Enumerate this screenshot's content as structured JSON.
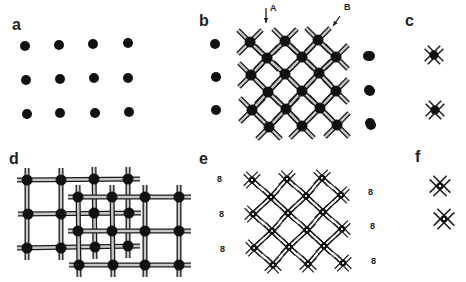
{
  "figure": {
    "panels": [
      {
        "id": "a",
        "label": "a",
        "label_pos": [
          12,
          28
        ]
      },
      {
        "id": "b",
        "label": "b",
        "label_pos": [
          200,
          24
        ]
      },
      {
        "id": "c",
        "label": "c",
        "label_pos": [
          405,
          24
        ]
      },
      {
        "id": "d",
        "label": "d",
        "label_pos": [
          10,
          165
        ]
      },
      {
        "id": "e",
        "label": "e",
        "label_pos": [
          200,
          165
        ]
      },
      {
        "id": "f",
        "label": "f",
        "label_pos": [
          414,
          163
        ]
      }
    ],
    "arrows": [
      {
        "label": "A",
        "label_pos": [
          270,
          8
        ],
        "from": [
          266,
          8
        ],
        "to": [
          266,
          23
        ]
      },
      {
        "label": "B",
        "label_pos": [
          345,
          6
        ],
        "from": [
          340,
          16
        ],
        "to": [
          333,
          26
        ]
      }
    ],
    "colors": {
      "dot": "#111111",
      "rod_outline": "#1a1a1a",
      "rod_fill": "#c8c8c8",
      "text": "#222222",
      "background": "#ffffff"
    },
    "eight_glyph": "8",
    "panel_a": {
      "dots": [
        [
          25,
          46
        ],
        [
          59,
          45
        ],
        [
          93,
          44
        ],
        [
          128,
          43
        ],
        [
          26,
          80
        ],
        [
          60,
          79
        ],
        [
          94,
          78
        ],
        [
          128,
          78
        ],
        [
          27,
          114
        ],
        [
          60,
          113
        ],
        [
          95,
          113
        ],
        [
          129,
          112
        ]
      ]
    },
    "panel_b": {
      "left_dots": [
        [
          215,
          44
        ],
        [
          216,
          77
        ],
        [
          216,
          110
        ]
      ],
      "right_dots": [
        [
          368,
          56
        ],
        [
          369,
          90
        ],
        [
          370,
          123
        ]
      ],
      "nodes": [
        [
          250,
          42
        ],
        [
          285,
          41
        ],
        [
          318,
          40
        ],
        [
          267,
          58
        ],
        [
          302,
          57
        ],
        [
          336,
          57
        ],
        [
          251,
          75
        ],
        [
          285,
          74
        ],
        [
          319,
          73
        ],
        [
          268,
          92
        ],
        [
          302,
          91
        ],
        [
          336,
          91
        ],
        [
          252,
          110
        ],
        [
          286,
          109
        ],
        [
          320,
          108
        ],
        [
          269,
          127
        ],
        [
          302,
          126
        ],
        [
          337,
          125
        ]
      ]
    },
    "panel_c": {
      "left_dots": [
        [
          370,
          56
        ],
        [
          370,
          91
        ],
        [
          371,
          125
        ]
      ],
      "crosses": [
        [
          434,
          55
        ],
        [
          435,
          110
        ]
      ]
    },
    "panel_d": {
      "grid_a_nodes": [
        [
          27,
          180
        ],
        [
          61,
          180
        ],
        [
          94,
          179
        ],
        [
          128,
          179
        ],
        [
          28,
          214
        ],
        [
          61,
          214
        ],
        [
          94,
          213
        ],
        [
          129,
          213
        ],
        [
          27,
          248
        ],
        [
          61,
          248
        ],
        [
          95,
          247
        ],
        [
          128,
          246
        ]
      ],
      "grid_b_nodes": [
        [
          78,
          197
        ],
        [
          112,
          197
        ],
        [
          145,
          197
        ],
        [
          179,
          197
        ],
        [
          78,
          231
        ],
        [
          112,
          231
        ],
        [
          145,
          231
        ],
        [
          179,
          231
        ],
        [
          79,
          265
        ],
        [
          113,
          265
        ],
        [
          145,
          265
        ],
        [
          179,
          265
        ]
      ]
    },
    "panel_e": {
      "left_eights": [
        [
          220,
          180
        ],
        [
          222,
          215
        ],
        [
          223,
          250
        ]
      ],
      "right_eights": [
        [
          371,
          193
        ],
        [
          373,
          227
        ],
        [
          374,
          262
        ]
      ],
      "nodes": [
        [
          252,
          180
        ],
        [
          287,
          179
        ],
        [
          322,
          178
        ],
        [
          271,
          197
        ],
        [
          306,
          196
        ],
        [
          341,
          195
        ],
        [
          253,
          214
        ],
        [
          288,
          213
        ],
        [
          323,
          212
        ],
        [
          272,
          231
        ],
        [
          307,
          230
        ],
        [
          342,
          229
        ],
        [
          254,
          248
        ],
        [
          289,
          247
        ],
        [
          324,
          246
        ],
        [
          273,
          265
        ],
        [
          308,
          264
        ],
        [
          343,
          263
        ]
      ]
    },
    "panel_f": {
      "crosses": [
        [
          440,
          186
        ],
        [
          444,
          219
        ]
      ]
    }
  }
}
